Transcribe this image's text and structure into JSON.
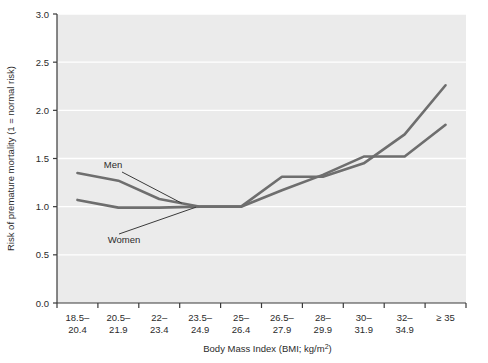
{
  "chart_data": {
    "type": "line",
    "title": "",
    "xlabel": "Body Mass Index (BMI; kg/m²)",
    "ylabel": "Risk of premature mortality (1 = normal risk)",
    "categories": [
      "18.5–20.4",
      "20.5–21.9",
      "22–23.4",
      "23.5–24.9",
      "25–26.4",
      "26.5–27.9",
      "28–29.9",
      "30–31.9",
      "32–34.9",
      "≥ 35"
    ],
    "category_lines": [
      [
        "18.5–",
        "20.4"
      ],
      [
        "20.5–",
        "21.9"
      ],
      [
        "22–",
        "23.4"
      ],
      [
        "23.5–",
        "24.9"
      ],
      [
        "25–",
        "26.4"
      ],
      [
        "26.5–",
        "27.9"
      ],
      [
        "28–",
        "29.9"
      ],
      [
        "30–",
        "31.9"
      ],
      [
        "32–",
        "34.9"
      ],
      [
        "≥ 35",
        ""
      ]
    ],
    "ylim": [
      0.0,
      3.0
    ],
    "yticks": [
      "0.0",
      "0.5",
      "1.0",
      "1.5",
      "2.0",
      "2.5",
      "3.0"
    ],
    "ytick_values": [
      0.0,
      0.5,
      1.0,
      1.5,
      2.0,
      2.5,
      3.0
    ],
    "grid": true,
    "grid_color": "#ffffff",
    "plot_background": "#ebebeb",
    "legend_position": "inline-annotation",
    "series": [
      {
        "name": "Men",
        "color": "#6e6e6e",
        "values": [
          1.35,
          1.27,
          1.08,
          1.0,
          1.0,
          1.31,
          1.31,
          1.45,
          1.75,
          2.26
        ]
      },
      {
        "name": "Women",
        "color": "#6e6e6e",
        "values": [
          1.07,
          0.99,
          0.99,
          1.0,
          1.0,
          1.17,
          1.33,
          1.52,
          1.52,
          1.85
        ]
      }
    ],
    "annotations": [
      {
        "label": "Men",
        "target_series": "Men"
      },
      {
        "label": "Women",
        "target_series": "Women"
      }
    ]
  }
}
